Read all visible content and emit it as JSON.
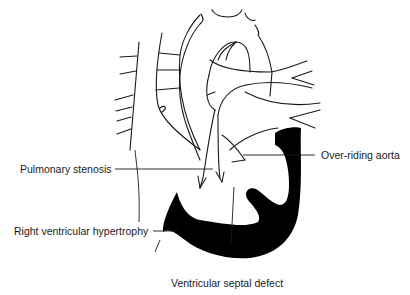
{
  "diagram": {
    "labels": {
      "pulmonary_stenosis": "Pulmonary stenosis",
      "over_riding_aorta": "Over-riding aorta",
      "right_ventricular_hypertrophy": "Right ventricular hypertrophy",
      "ventricular_septal_defect": "Ventricular septal defect"
    },
    "colors": {
      "line": "#1a1a1a",
      "ventricle_fill": "#000000",
      "background": "#ffffff"
    }
  }
}
